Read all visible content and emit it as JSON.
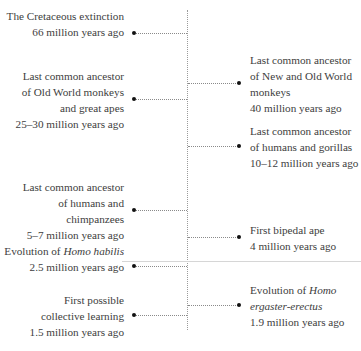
{
  "diagram": {
    "type": "timeline",
    "axis": "vertical",
    "events_left": [
      {
        "id": "cretaceous",
        "lines": [
          "The Cretaceous extinction",
          "66 million years ago"
        ],
        "title": "The Cretaceous extinction",
        "date": "66 million years ago",
        "dot_y": 33,
        "text_top": 8
      },
      {
        "id": "old-world-great-apes",
        "lines": [
          "Last common ancestor",
          "of Old World monkeys",
          "and great apes",
          "25–30 million years ago"
        ],
        "title": "Last common ancestor of Old World monkeys and great apes",
        "date": "25–30 million years ago",
        "dot_y": 99,
        "text_top": 68
      },
      {
        "id": "humans-chimpanzees",
        "lines": [
          "Last common ancestor",
          "of humans and",
          "chimpanzees",
          "5–7 million years ago"
        ],
        "title": "Last common ancestor of humans and chimpanzees",
        "date": "5–7 million years ago",
        "dot_y": 210,
        "text_top": 179
      },
      {
        "id": "homo-habilis",
        "lines_rich": [
          [
            "Evolution of ",
            "Homo habilis"
          ],
          [
            "2.5 million years ago",
            ""
          ]
        ],
        "line1_prefix": "Evolution of ",
        "line1_italic": "Homo habilis",
        "line2": "2.5 million years ago",
        "date": "2.5 million years ago",
        "dot_y": 266,
        "text_top": 243
      },
      {
        "id": "collective-learning",
        "lines": [
          "First possible",
          "collective learning",
          "1.5 million years ago"
        ],
        "title": "First possible collective learning",
        "date": "1.5 million years ago",
        "dot_y": 315,
        "text_top": 292
      }
    ],
    "events_right": [
      {
        "id": "new-old-world-monkeys",
        "lines": [
          "Last common ancestor",
          "of New and Old World",
          "monkeys",
          "40 million years ago"
        ],
        "title": "Last common ancestor of New and Old World monkeys",
        "date": "40 million years ago",
        "dot_y": 83,
        "text_top": 52
      },
      {
        "id": "humans-gorillas",
        "lines": [
          "Last common ancestor",
          "of humans and gorillas",
          "10–12 million years ago"
        ],
        "title": "Last common ancestor of humans and gorillas",
        "date": "10–12 million years ago",
        "dot_y": 146,
        "text_top": 123
      },
      {
        "id": "bipedal-ape",
        "lines": [
          "First bipedal ape",
          "4 million years ago"
        ],
        "title": "First bipedal ape",
        "date": "4 million years ago",
        "dot_y": 237,
        "text_top": 222
      },
      {
        "id": "homo-ergaster-erectus",
        "line1_prefix": "Evolution of ",
        "line1_italic": "Homo",
        "line2_italic": "ergaster-erectus",
        "line3": "1.9 million years ago",
        "date": "1.9 million years ago",
        "dot_y": 305,
        "text_top": 282
      }
    ],
    "colors": {
      "text": "#3d3d3d",
      "axis": "#9a9a9a",
      "connector": "#8a8a8a",
      "dot": "#111111",
      "divider": "#d6d6d6"
    }
  }
}
